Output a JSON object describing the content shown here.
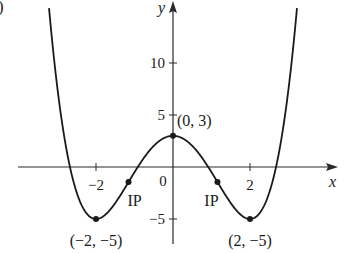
{
  "panel_label": ")",
  "chart_data": {
    "type": "line",
    "title": "",
    "xlabel": "x",
    "ylabel": "y",
    "function": "y = 0.5x^4 - 4x^2 + 3",
    "coefficients": {
      "a4": 0.5,
      "a2": -4,
      "a0": 3
    },
    "xlim": [
      -4.0,
      4.2
    ],
    "ylim": [
      -7.5,
      16
    ],
    "x_ticks": [
      {
        "value": -2,
        "label": "−2"
      },
      {
        "value": 2,
        "label": "2"
      }
    ],
    "y_ticks": [
      {
        "value": 10,
        "label": "10"
      },
      {
        "value": 5,
        "label": "5"
      },
      {
        "value": -5,
        "label": "−5"
      }
    ],
    "origin_label": "0",
    "grid": false,
    "curve_domain": [
      -3.22,
      3.22
    ],
    "points": [
      {
        "x": 0,
        "y": 3,
        "label": "(0, 3)",
        "kind": "local max"
      },
      {
        "x": -2,
        "y": -5,
        "label": "(−2, −5)",
        "kind": "local min"
      },
      {
        "x": 2,
        "y": -5,
        "label": "(2, −5)",
        "kind": "local min"
      },
      {
        "x": -1.155,
        "y": -1.44,
        "label": "IP",
        "kind": "inflection point"
      },
      {
        "x": 1.155,
        "y": -1.44,
        "label": "IP",
        "kind": "inflection point"
      }
    ],
    "colors": {
      "curve": "#1a1a1a",
      "axes": "#2a2a2a",
      "background": "#ffffff"
    }
  }
}
